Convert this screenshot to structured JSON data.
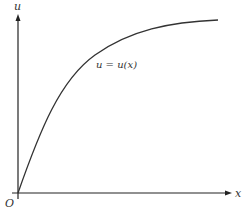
{
  "diagram": {
    "axes": {
      "x_label": "x",
      "y_label": "u",
      "origin_label": "O"
    },
    "curve": {
      "label": "u = u(x)",
      "shape": "increasing concave saturating curve from origin"
    },
    "colors": {
      "axis": "#222222",
      "curve": "#333333",
      "text": "#333333"
    }
  }
}
